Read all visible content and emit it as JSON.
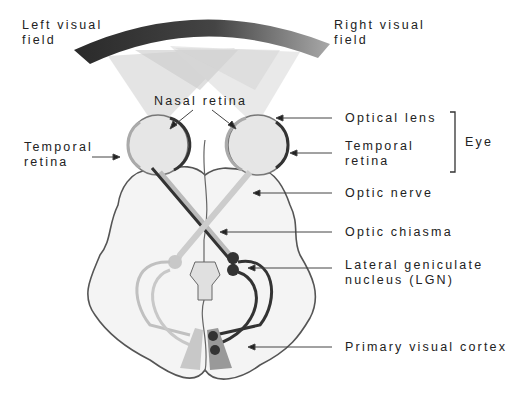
{
  "labels": {
    "left_visual_field": [
      "Left visual",
      "field"
    ],
    "right_visual_field": [
      "Right visual",
      "field"
    ],
    "nasal_retina": "Nasal retina",
    "temporal_retina_left": [
      "Temporal",
      "retina"
    ],
    "optical_lens": "Optical lens",
    "temporal_retina_right": [
      "Temporal",
      "retina"
    ],
    "eye": "Eye",
    "optic_nerve": "Optic nerve",
    "optic_chiasma": "Optic chiasma",
    "lgn": [
      "Lateral geniculate",
      "nucleus (LGN)"
    ],
    "primary_visual_cortex": "Primary visual cortex"
  },
  "colors": {
    "field_dark": "#2a2a2a",
    "field_light": "#a8a8a8",
    "left_pathway": "#b8b8b8",
    "right_pathway": "#3a3a3a",
    "brain_fill": "#f4f4f4",
    "brain_outline": "#555555"
  }
}
